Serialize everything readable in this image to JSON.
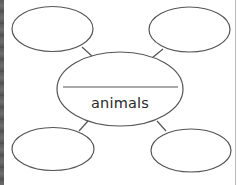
{
  "diagram": {
    "type": "concept-web",
    "center": {
      "label": "animals",
      "blank_line": true
    },
    "satellites": [
      {
        "position": "top-left",
        "label": ""
      },
      {
        "position": "top-right",
        "label": ""
      },
      {
        "position": "bottom-left",
        "label": ""
      },
      {
        "position": "bottom-right",
        "label": ""
      }
    ],
    "colors": {
      "stroke": "#555555",
      "background": "#ffffff",
      "text": "#2a2a2a"
    }
  }
}
